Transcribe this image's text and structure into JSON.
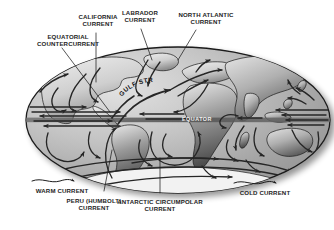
{
  "figure": {
    "type": "diagram",
    "projection": "elliptical (Mollweide-style) world map",
    "background_color": "#ffffff",
    "map_outline_color": "#1a1a1a",
    "ocean_fill": "#b9b9b9",
    "land_fill": "#d6d6d6",
    "current_arrow_color": "#262626"
  },
  "map": {
    "equator_label": "EQUATOR",
    "inline_labels": [
      {
        "name": "gulf-stream",
        "text": "GULF STREAM"
      },
      {
        "name": "equator",
        "text": "EQUATOR"
      }
    ]
  },
  "labels": [
    {
      "id": "equatorial-countercurrent",
      "lines": [
        "EQUATORIAL",
        "COUNTERCURRENT"
      ],
      "text": "EQUATORIAL\nCOUNTERCURRENT",
      "x": 68,
      "y": 39,
      "align": "center"
    },
    {
      "id": "california-current",
      "lines": [
        "CALIFORNIA",
        "CURRENT"
      ],
      "text": "CALIFORNIA\nCURRENT",
      "x": 98,
      "y": 19,
      "align": "center"
    },
    {
      "id": "labrador-current",
      "lines": [
        "LABRADOR",
        "CURRENT"
      ],
      "text": "LABRADOR\nCURRENT",
      "x": 140,
      "y": 15,
      "align": "center"
    },
    {
      "id": "north-atlantic-current",
      "lines": [
        "NORTH ATLANTIC",
        "CURRENT"
      ],
      "text": "NORTH ATLANTIC\nCURRENT",
      "x": 206,
      "y": 17,
      "align": "center"
    },
    {
      "id": "warm-current",
      "lines": [
        "WARM CURRENT"
      ],
      "text": "WARM CURRENT",
      "x": 62,
      "y": 190,
      "align": "center"
    },
    {
      "id": "peru-humbolt-current",
      "lines": [
        "PERU (HUMBOLT)",
        "CURRENT"
      ],
      "text": "PERU (HUMBOLT)\nCURRENT",
      "x": 94,
      "y": 201,
      "align": "center"
    },
    {
      "id": "antarctic-circumpolar-current",
      "lines": [
        "ANTARCTIC CIRCUMPOLAR",
        "CURRENT"
      ],
      "text": "ANTARCTIC CIRCUMPOLAR\nCURRENT",
      "x": 160,
      "y": 200,
      "align": "center"
    },
    {
      "id": "cold-current",
      "lines": [
        "COLD CURRENT"
      ],
      "text": "COLD CURRENT",
      "x": 265,
      "y": 192,
      "align": "center"
    }
  ],
  "legend": {
    "items": [
      {
        "id": "warm-current-key",
        "label": "WARM CURRENT",
        "style": "wavy arrow"
      },
      {
        "id": "cold-current-key",
        "label": "COLD CURRENT",
        "style": "wavy arrow"
      }
    ]
  }
}
